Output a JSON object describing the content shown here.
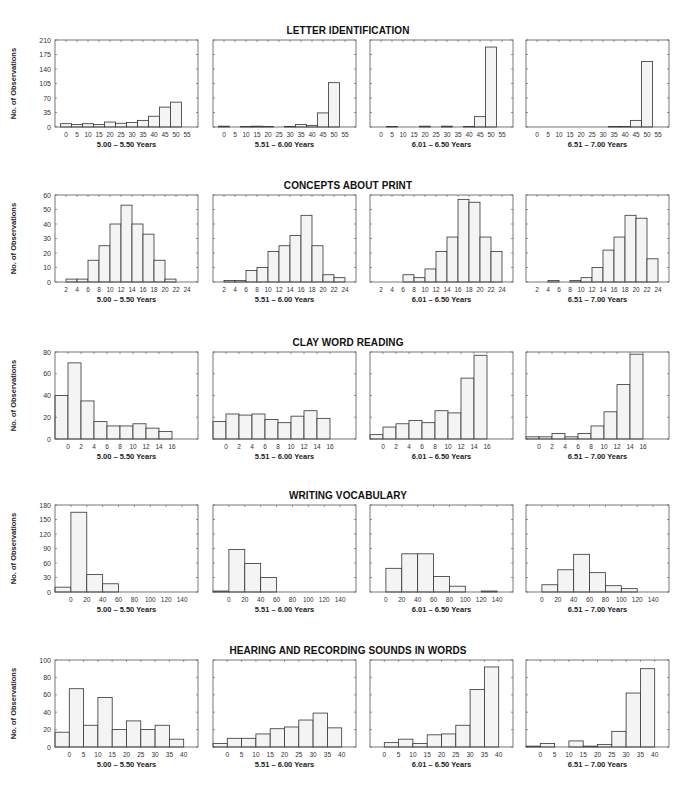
{
  "figure": {
    "ylabel": "No. of Observations",
    "bar_fill": "#f4f4f4",
    "bar_stroke": "#333333",
    "frame_stroke": "#555555",
    "age_groups": [
      "5.00 – 5.50 Years",
      "5.51 – 6.00 Years",
      "6.01 – 6.50 Years",
      "6.51 – 7.00 Years"
    ]
  },
  "rows": [
    {
      "title": "LETTER IDENTIFICATION"
    },
    {
      "title": "CONCEPTS ABOUT PRINT"
    },
    {
      "title": "CLAY WORD READING"
    },
    {
      "title": "WRITING VOCABULARY"
    },
    {
      "title": "HEARING AND RECORDING SOUNDS IN WORDS"
    }
  ],
  "chart_data": [
    {
      "type": "bar",
      "title": "LETTER IDENTIFICATION",
      "ylabel": "No. of Observations",
      "ylim": [
        0,
        210
      ],
      "yticks": [
        0,
        35,
        70,
        105,
        140,
        175,
        210
      ],
      "xticks": [
        0,
        5,
        10,
        15,
        20,
        25,
        30,
        35,
        40,
        45,
        50,
        55
      ],
      "bin_edges": [
        -2.5,
        2.5,
        7.5,
        12.5,
        17.5,
        22.5,
        27.5,
        32.5,
        37.5,
        42.5,
        47.5,
        52.5,
        57.5
      ],
      "xlim": [
        -5,
        60
      ],
      "series": [
        {
          "name": "5.00 – 5.50 Years",
          "values": [
            8,
            6,
            8,
            6,
            12,
            9,
            11,
            16,
            26,
            48,
            60,
            0
          ]
        },
        {
          "name": "5.51 – 6.00 Years",
          "values": [
            2,
            0,
            1,
            2,
            1,
            0,
            1,
            6,
            4,
            34,
            107,
            0
          ]
        },
        {
          "name": "6.01 – 6.50 Years",
          "values": [
            0,
            1,
            0,
            0,
            2,
            0,
            2,
            0,
            1,
            25,
            193,
            0
          ]
        },
        {
          "name": "6.51 – 7.00 Years",
          "values": [
            0,
            0,
            0,
            0,
            0,
            0,
            0,
            1,
            1,
            16,
            158,
            0
          ]
        }
      ]
    },
    {
      "type": "bar",
      "title": "CONCEPTS ABOUT PRINT",
      "ylabel": "No. of Observations",
      "ylim": [
        0,
        60
      ],
      "yticks": [
        0,
        10,
        20,
        30,
        40,
        50,
        60
      ],
      "xticks": [
        2,
        4,
        6,
        8,
        10,
        12,
        14,
        16,
        18,
        20,
        22,
        24
      ],
      "bin_edges": [
        2,
        4,
        6,
        8,
        10,
        12,
        14,
        16,
        18,
        20,
        22,
        24
      ],
      "xlim": [
        0,
        26
      ],
      "series": [
        {
          "name": "5.00 – 5.50 Years",
          "values": [
            2,
            2,
            15,
            25,
            40,
            53,
            40,
            33,
            15,
            2,
            0
          ]
        },
        {
          "name": "5.51 – 6.00 Years",
          "values": [
            1,
            1,
            8,
            10,
            21,
            25,
            32,
            46,
            25,
            5,
            3
          ]
        },
        {
          "name": "6.01 – 6.50 Years",
          "values": [
            0,
            0,
            5,
            3,
            9,
            21,
            31,
            57,
            55,
            31,
            21
          ]
        },
        {
          "name": "6.51 – 7.00 Years",
          "values": [
            0,
            1,
            0,
            1,
            3,
            10,
            22,
            31,
            46,
            44,
            16
          ]
        }
      ]
    },
    {
      "type": "bar",
      "title": "CLAY WORD READING",
      "ylabel": "No. of Observations",
      "ylim": [
        0,
        80
      ],
      "yticks": [
        0,
        20,
        40,
        60,
        80
      ],
      "xticks": [
        0,
        2,
        4,
        6,
        8,
        10,
        12,
        14,
        16
      ],
      "bin_edges": [
        -2,
        0,
        2,
        4,
        6,
        8,
        10,
        12,
        14,
        16
      ],
      "xlim": [
        -2,
        20
      ],
      "series": [
        {
          "name": "5.00 – 5.50 Years",
          "values": [
            40,
            70,
            35,
            16,
            12,
            12,
            14,
            10,
            7
          ]
        },
        {
          "name": "5.51 – 6.00 Years",
          "values": [
            16,
            23,
            22,
            23,
            18,
            15,
            21,
            26,
            19
          ]
        },
        {
          "name": "6.01 – 6.50 Years",
          "values": [
            4,
            11,
            14,
            17,
            15,
            26,
            24,
            56,
            77
          ]
        },
        {
          "name": "6.51 – 7.00 Years",
          "values": [
            2,
            2,
            5,
            2,
            5,
            12,
            25,
            50,
            78
          ]
        }
      ]
    },
    {
      "type": "bar",
      "title": "WRITING VOCABULARY",
      "ylabel": "No. of Observations",
      "ylim": [
        0,
        180
      ],
      "yticks": [
        0,
        30,
        60,
        90,
        120,
        150,
        180
      ],
      "xticks": [
        0,
        20,
        40,
        60,
        80,
        100,
        120,
        140
      ],
      "bin_edges": [
        -20,
        0,
        20,
        40,
        60,
        80,
        100,
        120,
        140
      ],
      "xlim": [
        -20,
        160
      ],
      "series": [
        {
          "name": "5.00 – 5.50 Years",
          "values": [
            10,
            165,
            36,
            17,
            0,
            0,
            0,
            0
          ]
        },
        {
          "name": "5.51 – 6.00 Years",
          "values": [
            2,
            88,
            59,
            30,
            0,
            0,
            0,
            0
          ]
        },
        {
          "name": "6.01 – 6.50 Years",
          "values": [
            0,
            49,
            79,
            79,
            32,
            12,
            0,
            2
          ]
        },
        {
          "name": "6.51 – 7.00 Years",
          "values": [
            0,
            15,
            46,
            78,
            40,
            13,
            7,
            0
          ]
        }
      ]
    },
    {
      "type": "bar",
      "title": "HEARING AND RECORDING SOUNDS IN WORDS",
      "ylabel": "No. of Observations",
      "ylim": [
        0,
        100
      ],
      "yticks": [
        0,
        20,
        40,
        60,
        80,
        100
      ],
      "xticks": [
        0,
        5,
        10,
        15,
        20,
        25,
        30,
        35,
        40
      ],
      "bin_edges": [
        -5,
        0,
        5,
        10,
        15,
        20,
        25,
        30,
        35,
        40
      ],
      "xlim": [
        -5,
        45
      ],
      "series": [
        {
          "name": "5.00 – 5.50 Years",
          "values": [
            17,
            67,
            25,
            57,
            20,
            30,
            20,
            25,
            9
          ]
        },
        {
          "name": "5.51 – 6.00 Years",
          "values": [
            4,
            10,
            10,
            15,
            21,
            23,
            31,
            39,
            22
          ]
        },
        {
          "name": "6.01 – 6.50 Years",
          "values": [
            0,
            5,
            9,
            4,
            14,
            15,
            25,
            66,
            92
          ]
        },
        {
          "name": "6.51 – 7.00 Years",
          "values": [
            1,
            4,
            0,
            7,
            1,
            3,
            18,
            62,
            90
          ]
        }
      ]
    }
  ]
}
